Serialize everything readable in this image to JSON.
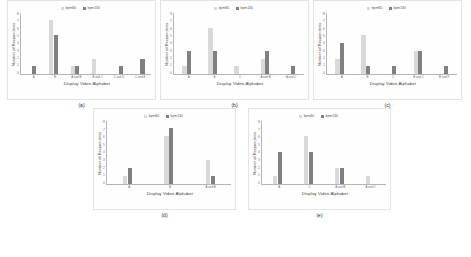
{
  "figure": {
    "legend": {
      "series_light_label": "bpm80",
      "series_dark_label": "bpm130",
      "color_light": "#d9d9d9",
      "color_dark": "#808080"
    },
    "axis": {
      "xlabel": "Display Video Alphabet",
      "ylabel": "Number of Respondents",
      "yticks": [
        "8",
        "7",
        "6",
        "5",
        "4",
        "3",
        "2",
        "1",
        "0"
      ],
      "ymin": 0,
      "ymax": 8
    },
    "captions": {
      "a": "(a)",
      "b": "(b)",
      "c": "(c)",
      "d": "(d)",
      "e": "(e)"
    }
  },
  "chart_data": [
    {
      "id": "a",
      "type": "bar",
      "title": "(a)",
      "xlabel": "Display Video Alphabet",
      "ylabel": "Number of Respondents",
      "ylim": [
        0,
        8
      ],
      "grid": false,
      "legend_position": "top-center",
      "categories": [
        "A",
        "B",
        "A and B",
        "B and C",
        "C and D",
        "C and E"
      ],
      "series": [
        {
          "name": "bpm80",
          "color": "#d9d9d9",
          "values": [
            0,
            7,
            1,
            2,
            0,
            0
          ]
        },
        {
          "name": "bpm130",
          "color": "#808080",
          "values": [
            1,
            5,
            1,
            0,
            1,
            2
          ]
        }
      ]
    },
    {
      "id": "b",
      "type": "bar",
      "title": "(b)",
      "xlabel": "Display Video Alphabet",
      "ylabel": "Number of Respondents",
      "ylim": [
        0,
        8
      ],
      "grid": false,
      "legend_position": "top-center",
      "categories": [
        "A",
        "B",
        "C",
        "A and B",
        "A and C"
      ],
      "series": [
        {
          "name": "bpm80",
          "color": "#d9d9d9",
          "values": [
            1,
            6,
            1,
            2,
            0
          ]
        },
        {
          "name": "bpm130",
          "color": "#808080",
          "values": [
            3,
            3,
            0,
            3,
            1
          ]
        }
      ]
    },
    {
      "id": "c",
      "type": "bar",
      "title": "(c)",
      "xlabel": "Display Video Alphabet",
      "ylabel": "Number of Respondents",
      "ylim": [
        0,
        8
      ],
      "grid": false,
      "legend_position": "top-center",
      "categories": [
        "A",
        "B",
        "C",
        "B and C",
        "B and F"
      ],
      "series": [
        {
          "name": "bpm80",
          "color": "#d9d9d9",
          "values": [
            2,
            5,
            0,
            3,
            0
          ]
        },
        {
          "name": "bpm130",
          "color": "#808080",
          "values": [
            4,
            1,
            1,
            3,
            1
          ]
        }
      ]
    },
    {
      "id": "d",
      "type": "bar",
      "title": "(d)",
      "xlabel": "Display Video Alphabet",
      "ylabel": "Number of Respondents",
      "ylim": [
        0,
        8
      ],
      "grid": false,
      "legend_position": "top-center",
      "categories": [
        "A",
        "B",
        "A and B"
      ],
      "series": [
        {
          "name": "bpm80",
          "color": "#d9d9d9",
          "values": [
            1,
            6,
            3
          ]
        },
        {
          "name": "bpm130",
          "color": "#808080",
          "values": [
            2,
            7,
            1
          ]
        }
      ]
    },
    {
      "id": "e",
      "type": "bar",
      "title": "(e)",
      "xlabel": "Display Video Alphabet",
      "ylabel": "Number of Respondents",
      "ylim": [
        0,
        8
      ],
      "grid": false,
      "legend_position": "top-center",
      "categories": [
        "A",
        "C",
        "A and B",
        "A and C"
      ],
      "series": [
        {
          "name": "bpm80",
          "color": "#d9d9d9",
          "values": [
            1,
            6,
            2,
            1
          ]
        },
        {
          "name": "bpm130",
          "color": "#808080",
          "values": [
            4,
            4,
            2,
            0
          ]
        }
      ]
    }
  ]
}
